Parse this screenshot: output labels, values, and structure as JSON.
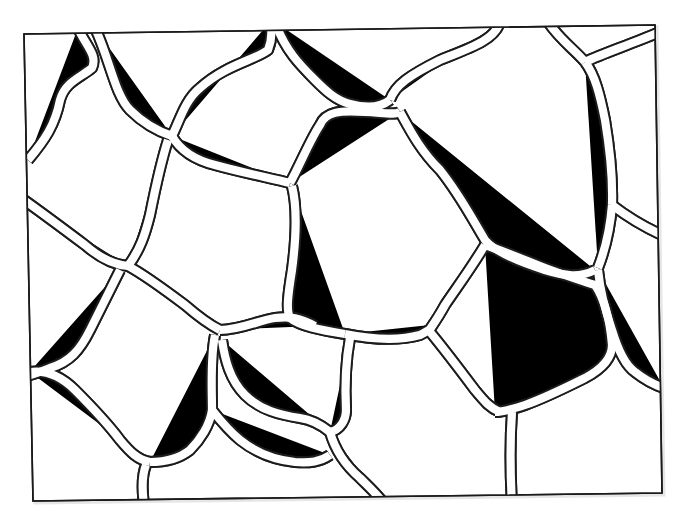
{
  "figure": {
    "title": "",
    "colors": {
      "line": "#1c1c1c",
      "background": "#ffffff",
      "cell_fill": "#ffffff"
    },
    "frame_corners": [
      [
        24,
        34
      ],
      [
        655,
        25
      ],
      [
        662,
        493
      ],
      [
        33,
        501
      ]
    ],
    "cell_count_approx": 22
  }
}
